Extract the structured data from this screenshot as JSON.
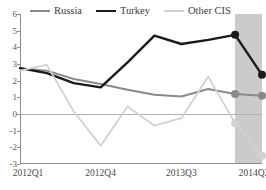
{
  "chart_data": {
    "type": "line",
    "title": "",
    "xlabel": "",
    "ylabel": "",
    "x": [
      "2012Q1",
      "2012Q2",
      "2012Q3",
      "2012Q4",
      "2013Q1",
      "2013Q2",
      "2013Q3",
      "2013Q4",
      "2014Q1",
      "2014Q2"
    ],
    "tick_labels": [
      "2012Q1",
      "2012Q4",
      "2013Q3",
      "2014Q2"
    ],
    "tick_indices": [
      0,
      3,
      6,
      9
    ],
    "ylim": [
      -3,
      6
    ],
    "y_ticks": [
      6,
      5,
      4,
      3,
      2,
      1,
      0,
      -1,
      -2,
      -3
    ],
    "grid": false,
    "zero_line": true,
    "legend_position": "top",
    "forecast": {
      "label": "",
      "start_index": 8,
      "shaded": true,
      "marker_indices": [
        8,
        9
      ],
      "band_color": "#b9b9b9"
    },
    "series": [
      {
        "name": "Russia",
        "color": "#8a8a8a",
        "width": 2,
        "values": [
          2.75,
          2.6,
          2.1,
          1.8,
          1.45,
          1.15,
          1.05,
          1.5,
          1.2,
          1.1
        ]
      },
      {
        "name": "Turkey",
        "color": "#1a1a1a",
        "width": 2.4,
        "values": [
          2.75,
          2.45,
          1.85,
          1.6,
          3.1,
          4.7,
          4.2,
          4.45,
          4.75,
          2.35
        ]
      },
      {
        "name": "Other CIS",
        "color": "#d2d2d2",
        "width": 1.8,
        "values": [
          2.6,
          2.95,
          0.15,
          -1.9,
          0.45,
          -0.7,
          -0.25,
          2.25,
          -0.55,
          -2.5
        ]
      }
    ]
  }
}
